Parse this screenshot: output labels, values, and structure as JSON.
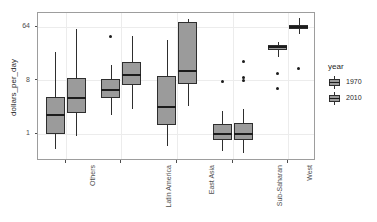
{
  "chart_data": {
    "type": "box",
    "title": "",
    "xlabel": "",
    "ylabel": "dollars_per_day",
    "yscale": "log2",
    "ylim": [
      0.35,
      110
    ],
    "yticks": [
      1,
      8,
      64
    ],
    "ytick_labels": [
      "1",
      "8",
      "64"
    ],
    "grid": true,
    "legend": {
      "title": "year",
      "position": "right",
      "entries": [
        {
          "label": "1970",
          "fill": "#9b9b9b"
        },
        {
          "label": "2010",
          "fill": "#9b9b9b"
        }
      ]
    },
    "categories": [
      "Others",
      "Latin America",
      "East Asia",
      "Sub-Saharan",
      "West"
    ],
    "series": [
      {
        "name": "1970",
        "boxes": [
          {
            "category": "Others",
            "lower_whisker": 0.55,
            "q1": 1.0,
            "median": 2.1,
            "q3": 4.2,
            "upper_whisker": 24.0,
            "outliers": []
          },
          {
            "category": "Latin America",
            "lower_whisker": 2.1,
            "q1": 4.0,
            "median": 5.6,
            "q3": 8.5,
            "upper_whisker": 14.5,
            "outliers": [
              44.0
            ]
          },
          {
            "category": "East Asia",
            "lower_whisker": 0.62,
            "q1": 1.4,
            "median": 2.9,
            "q3": 9.6,
            "upper_whisker": 38.0,
            "outliers": []
          },
          {
            "category": "Sub-Saharan",
            "lower_whisker": 0.52,
            "q1": 0.8,
            "median": 1.0,
            "q3": 1.45,
            "upper_whisker": 2.4,
            "outliers": [
              7.6
            ]
          },
          {
            "category": "West",
            "lower_whisker": 20.0,
            "q1": 26.0,
            "median": 29.0,
            "q3": 32.0,
            "upper_whisker": 36.0,
            "outliers": [
              10.5,
              5.8
            ]
          }
        ]
      },
      {
        "name": "2010",
        "boxes": [
          {
            "category": "Others",
            "lower_whisker": 0.92,
            "q1": 2.3,
            "median": 4.1,
            "q3": 8.8,
            "upper_whisker": 60.0,
            "outliers": []
          },
          {
            "category": "Latin America",
            "lower_whisker": 2.6,
            "q1": 6.6,
            "median": 10.0,
            "q3": 16.5,
            "upper_whisker": 45.0,
            "outliers": []
          },
          {
            "category": "East Asia",
            "lower_whisker": 3.0,
            "q1": 7.1,
            "median": 11.5,
            "q3": 78.0,
            "upper_whisker": 88.0,
            "outliers": []
          },
          {
            "category": "Sub-Saharan",
            "lower_whisker": 0.48,
            "q1": 0.8,
            "median": 1.0,
            "q3": 1.55,
            "upper_whisker": 2.6,
            "outliers": [
              16.5,
              8.9,
              8.0
            ]
          },
          {
            "category": "West",
            "lower_whisker": 48.0,
            "q1": 58.0,
            "median": 64.0,
            "q3": 70.0,
            "upper_whisker": 92.0,
            "outliers": [
              12.5
            ]
          }
        ]
      }
    ]
  }
}
